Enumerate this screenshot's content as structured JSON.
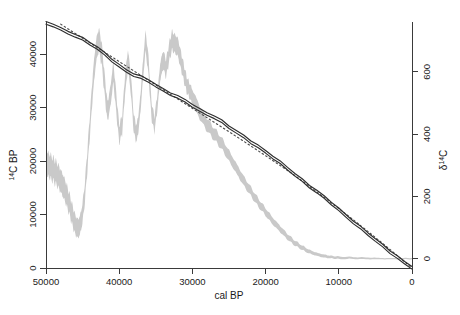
{
  "chart_data": {
    "type": "line",
    "title": "",
    "subtitle": "",
    "xlabel": "cal BP",
    "ylabel": "14C BP",
    "y2label": "d14C",
    "xlim": [
      50000,
      0
    ],
    "ylim": [
      0,
      46000
    ],
    "y2lim": [
      -30,
      760
    ],
    "x_reversed": true,
    "grid": false,
    "legend": null,
    "legend_position": "none",
    "xticks": [
      50000,
      40000,
      30000,
      20000,
      10000,
      0
    ],
    "xtick_labels": [
      "50000",
      "40000",
      "30000",
      "20000",
      "10000",
      "0"
    ],
    "yticks": [
      0,
      10000,
      20000,
      30000,
      40000
    ],
    "ytick_labels": [
      "0",
      "10000",
      "20000",
      "30000",
      "40000"
    ],
    "y2ticks": [
      0,
      200,
      400,
      600
    ],
    "y2tick_labels": [
      "0",
      "200",
      "400",
      "600"
    ],
    "ylabel_parts": {
      "sup": "14",
      "rest": "C BP"
    },
    "y2label_parts": {
      "delta": "δ",
      "sup": "14",
      "rest": "C"
    },
    "colors": {
      "band_grey": "#c9c9c9",
      "calibration_curve": "#2e2e2e",
      "reference_line": "#4a4a4a",
      "axis": "#3a3a3a",
      "background": "#ffffff"
    },
    "series": [
      {
        "name": "radiocarbon calibration curve (14C BP)",
        "style": "solid-dark-band",
        "axis": "left",
        "x": [
          50000,
          49000,
          48000,
          47000,
          46000,
          45000,
          44000,
          43000,
          42000,
          41000,
          40000,
          39000,
          38000,
          37000,
          36000,
          35000,
          34000,
          33000,
          32000,
          31000,
          30000,
          29000,
          28000,
          27000,
          26000,
          25000,
          24000,
          23000,
          22000,
          21000,
          20000,
          19000,
          18000,
          17000,
          16000,
          15000,
          14000,
          13000,
          12000,
          11000,
          10000,
          9000,
          8000,
          7000,
          6000,
          5000,
          4000,
          3000,
          2000,
          1000,
          0
        ],
        "y": [
          45800,
          45300,
          44700,
          44100,
          43400,
          42700,
          41900,
          41000,
          40000,
          38900,
          37800,
          36900,
          36100,
          35500,
          34900,
          34000,
          33200,
          32600,
          32000,
          31300,
          30400,
          29400,
          28700,
          28100,
          27300,
          26400,
          25500,
          24600,
          23600,
          22600,
          21600,
          20600,
          19600,
          18600,
          17500,
          16400,
          15300,
          14200,
          13100,
          12000,
          10800,
          9700,
          8600,
          7500,
          6400,
          5200,
          4000,
          2900,
          1900,
          950,
          0
        ]
      },
      {
        "name": "reference / linear trend (dotted)",
        "style": "dotted",
        "axis": "left",
        "x": [
          48000,
          44000,
          40000,
          36000,
          32000,
          28000,
          24000,
          20000,
          16000,
          12000,
          8000,
          4000,
          0
        ],
        "y": [
          45600,
          42100,
          38600,
          35100,
          31600,
          28100,
          24600,
          21000,
          17300,
          13200,
          9000,
          4600,
          0
        ]
      },
      {
        "name": "d14C (grey envelope)",
        "style": "grey-envelope",
        "axis": "right",
        "x": [
          50000,
          49600,
          49200,
          48800,
          48400,
          48000,
          47600,
          47200,
          46800,
          46400,
          46000,
          45600,
          45200,
          44800,
          44400,
          44000,
          43600,
          43200,
          42800,
          42400,
          42000,
          41600,
          41200,
          40800,
          40400,
          40000,
          39600,
          39200,
          38800,
          38400,
          38000,
          37600,
          37200,
          36800,
          36400,
          36000,
          35600,
          35200,
          34800,
          34400,
          34000,
          33600,
          33200,
          32800,
          32400,
          32000,
          31600,
          31200,
          30800,
          30400,
          30000,
          29000,
          28000,
          27000,
          26000,
          25000,
          24000,
          23000,
          22000,
          21000,
          20000,
          19000,
          18000,
          17000,
          16000,
          15000,
          14000,
          13000,
          12000,
          11000,
          10000,
          8000,
          6000,
          4000,
          2000,
          0
        ],
        "y_mid": [
          305,
          300,
          290,
          280,
          268,
          250,
          230,
          205,
          175,
          140,
          108,
          95,
          120,
          185,
          300,
          430,
          560,
          660,
          705,
          660,
          560,
          470,
          520,
          600,
          500,
          400,
          430,
          560,
          640,
          560,
          430,
          400,
          470,
          590,
          700,
          620,
          480,
          430,
          500,
          600,
          640,
          610,
          660,
          700,
          690,
          680,
          640,
          600,
          560,
          540,
          520,
          470,
          430,
          400,
          370,
          330,
          290,
          250,
          215,
          180,
          150,
          120,
          95,
          70,
          50,
          35,
          22,
          14,
          8,
          5,
          3,
          2,
          1,
          0,
          0,
          0
        ],
        "band_halfwidth": [
          38,
          38,
          37,
          37,
          36,
          36,
          35,
          34,
          33,
          32,
          31,
          30,
          30,
          31,
          32,
          34,
          35,
          36,
          36,
          35,
          33,
          31,
          32,
          33,
          31,
          29,
          29,
          31,
          32,
          31,
          28,
          27,
          28,
          30,
          32,
          30,
          27,
          25,
          26,
          28,
          29,
          28,
          29,
          30,
          30,
          29,
          28,
          26,
          25,
          24,
          23,
          21,
          20,
          19,
          18,
          17,
          16,
          15,
          14,
          13,
          12,
          11,
          10,
          9,
          8,
          7,
          6,
          5,
          5,
          4,
          4,
          3,
          3,
          2,
          2,
          2
        ]
      }
    ],
    "annotations": []
  },
  "figure": {
    "xlabel": "cal BP",
    "alt": "Radiocarbon calibration curve: 14C BP versus cal BP with d14C grey envelope on secondary axis"
  }
}
